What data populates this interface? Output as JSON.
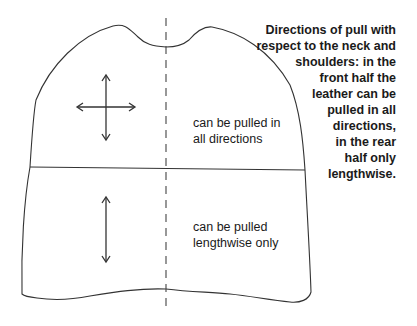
{
  "diagram": {
    "caption_lines": [
      "Directions of pull with",
      "respect to the neck and",
      "shoulders: in the",
      "front half the",
      "leather can be",
      "pulled in all",
      "directions,",
      "in the rear",
      "half only",
      "lengthwise."
    ],
    "front_region": {
      "label_lines": [
        "can be pulled in",
        "all directions"
      ],
      "arrow_icon": "four-way-arrow"
    },
    "rear_region": {
      "label_lines": [
        "can be pulled",
        "lengthwise only"
      ],
      "arrow_icon": "vertical-double-arrow"
    },
    "colors": {
      "outline": "#333333",
      "background": "#ffffff"
    }
  }
}
